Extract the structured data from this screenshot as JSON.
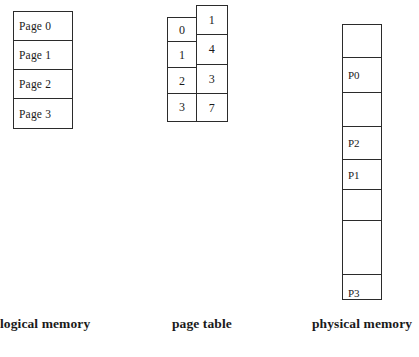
{
  "figure": {
    "background_color": "#ffffff",
    "line_color": "#2b2b2b"
  },
  "logical_memory": {
    "caption": "logical memory",
    "cells": [
      {
        "label": "Page 0"
      },
      {
        "label": "Page 1"
      },
      {
        "label": "Page 2"
      },
      {
        "label": "Page 3"
      }
    ]
  },
  "page_table": {
    "caption": "page table",
    "index_column": [
      "0",
      "1",
      "2",
      "3"
    ],
    "frame_column": [
      "1",
      "4",
      "3",
      "7"
    ]
  },
  "physical_memory": {
    "caption": "physical memory",
    "frames": [
      {
        "label": ""
      },
      {
        "label": "P0"
      },
      {
        "label": ""
      },
      {
        "label": "P2"
      },
      {
        "label": "P1"
      },
      {
        "label": ""
      },
      {
        "label": ""
      },
      {
        "label": "P3"
      }
    ]
  }
}
